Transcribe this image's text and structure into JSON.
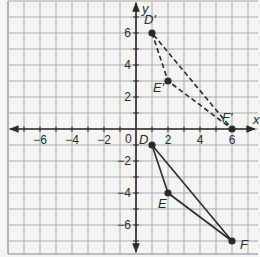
{
  "diagram": {
    "type": "coordinate-plane-transformation",
    "axes": {
      "x_label": "x",
      "y_label": "y",
      "origin_label": "0",
      "x_ticks": [
        {
          "value": -6,
          "label": "−6"
        },
        {
          "value": -4,
          "label": "−4"
        },
        {
          "value": -2,
          "label": "−2"
        },
        {
          "value": 2,
          "label": "2"
        },
        {
          "value": 4,
          "label": "4"
        },
        {
          "value": 6,
          "label": "6"
        }
      ],
      "y_ticks": [
        {
          "value": 6,
          "label": "6"
        },
        {
          "value": 4,
          "label": "4"
        },
        {
          "value": 2,
          "label": "2"
        },
        {
          "value": -2,
          "label": "−2"
        },
        {
          "value": -4,
          "label": "−4"
        },
        {
          "value": -6,
          "label": "−6"
        }
      ],
      "x_range": [
        -8,
        7.5
      ],
      "y_range": [
        -8,
        8
      ],
      "grid": true
    },
    "original_triangle": {
      "style": "solid",
      "color": "#2a2a2a",
      "points": [
        {
          "name": "D",
          "x": 1,
          "y": -1
        },
        {
          "name": "E",
          "x": 2,
          "y": -4
        },
        {
          "name": "F",
          "x": 6,
          "y": -7
        }
      ]
    },
    "image_triangle": {
      "style": "dashed",
      "color": "#2a2a2a",
      "points": [
        {
          "name": "D′",
          "x": 1,
          "y": 6
        },
        {
          "name": "E′",
          "x": 2,
          "y": 3
        },
        {
          "name": "F′",
          "x": 6,
          "y": 0
        }
      ]
    }
  },
  "colors": {
    "background": "#f4f4f2",
    "grid": "#a8a8a8",
    "axis": "#2a2a2a",
    "ink": "#2a2a2a"
  }
}
